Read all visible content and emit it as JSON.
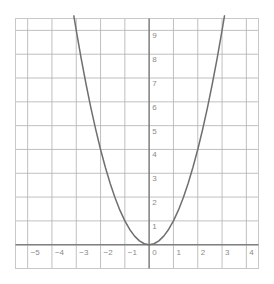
{
  "chart_data": {
    "type": "line",
    "title": "",
    "subtitle": "",
    "xlabel": "",
    "ylabel": "",
    "function": "y = x^2",
    "grid": true,
    "legend": null,
    "xlim": [
      -5.5,
      4.5
    ],
    "ylim": [
      -1,
      9.5
    ],
    "xticks": [
      "−5",
      "−4",
      "−3",
      "−2",
      "−1",
      "0",
      "1",
      "2",
      "3",
      "4"
    ],
    "xtick_values": [
      -5,
      -4,
      -3,
      -2,
      -1,
      0,
      1,
      2,
      3,
      4
    ],
    "yticks": [
      "1",
      "2",
      "3",
      "4",
      "5",
      "6",
      "7",
      "8",
      "9"
    ],
    "ytick_values": [
      1,
      2,
      3,
      4,
      5,
      6,
      7,
      8,
      9
    ],
    "series": [
      {
        "name": "y = x^2",
        "color": "#6f6f6f",
        "x": [
          -3.1,
          -3.0,
          -2.8,
          -2.6,
          -2.4,
          -2.2,
          -2.0,
          -1.8,
          -1.6,
          -1.4,
          -1.2,
          -1.0,
          -0.8,
          -0.6,
          -0.4,
          -0.2,
          0.0,
          0.2,
          0.4,
          0.6,
          0.8,
          1.0,
          1.2,
          1.4,
          1.6,
          1.8,
          2.0,
          2.2,
          2.4,
          2.6,
          2.8,
          3.0,
          3.1
        ],
        "y": [
          9.61,
          9.0,
          7.84,
          6.76,
          5.76,
          4.84,
          4.0,
          3.24,
          2.56,
          1.96,
          1.44,
          1.0,
          0.64,
          0.36,
          0.16,
          0.04,
          0.0,
          0.04,
          0.16,
          0.36,
          0.64,
          1.0,
          1.44,
          1.96,
          2.56,
          3.24,
          4.0,
          4.84,
          5.76,
          6.76,
          7.84,
          9.0,
          9.61
        ]
      }
    ]
  },
  "style": {
    "background": "#ffffff",
    "grid_color": "#b0b0b0",
    "axis_color": "#808080",
    "border_color": "#c8c8c8",
    "curve_color": "#6f6f6f",
    "tick_label_color": "#8a8a8a"
  }
}
